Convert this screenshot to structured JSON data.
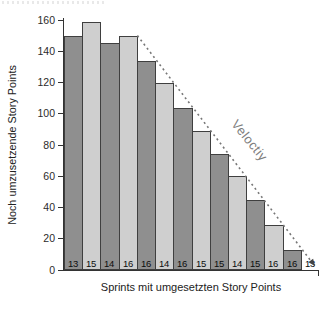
{
  "chart_data": {
    "type": "bar",
    "title": "",
    "xlabel": "Sprints mit umgesetzten Story Points",
    "ylabel": "Noch umzusetzende Story Points",
    "ylim": [
      0,
      160
    ],
    "yticks": [
      0,
      20,
      40,
      60,
      80,
      100,
      120,
      140,
      160
    ],
    "grid": false,
    "categories": [
      "Sprint 1",
      "Sprint 2",
      "Sprint 3",
      "Sprint 4",
      "Sprint 5",
      "Sprint 6",
      "Sprint 7",
      "Sprint 8",
      "Sprint 9",
      "Sprint 10",
      "Sprint 11",
      "Sprint 12",
      "Sprint 13",
      "Sprint 14"
    ],
    "values": [
      150,
      159,
      145,
      150,
      134,
      120,
      104,
      89,
      74,
      60,
      45,
      29,
      13,
      0
    ],
    "bar_labels": [
      "13",
      "15",
      "14",
      "16",
      "16",
      "14",
      "16",
      "15",
      "15",
      "14",
      "15",
      "16",
      "16",
      "13"
    ],
    "bar_color_odd": "#8f8f8f",
    "bar_color_even": "#cfcfcf",
    "bar_border_color": "#3f3f3f",
    "annotation": {
      "label": "Veloctiy",
      "line_style": "dotted-arrow",
      "line_color": "#777777",
      "from": {
        "sprint": 4,
        "value": 150
      },
      "to": {
        "sprint": 14,
        "value": 0
      }
    }
  }
}
